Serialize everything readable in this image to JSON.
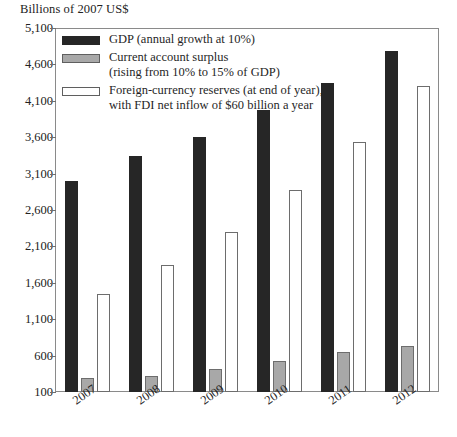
{
  "chart_data": {
    "type": "bar",
    "title": "",
    "ylabel": "Billions of 2007 US$",
    "xlabel": "",
    "grid": false,
    "legend_position": "top-left-inside",
    "ylim": [
      100,
      5100
    ],
    "ytick_labels": [
      "5,100",
      "4,600",
      "4,100",
      "3,600",
      "3,100",
      "2,600",
      "2,100",
      "1,600",
      "1,100",
      "600",
      "100"
    ],
    "yticks": [
      5100,
      4600,
      4100,
      3600,
      3100,
      2600,
      2100,
      1600,
      1100,
      600,
      100
    ],
    "categories": [
      "2007",
      "2008",
      "2009",
      "2010",
      "2011",
      "2012"
    ],
    "series": [
      {
        "name": "GDP (annual growth at 10%)",
        "color": "#262626",
        "values": [
          3000,
          3340,
          3600,
          3980,
          4350,
          4780
        ]
      },
      {
        "name": "Current account surplus (rising from 10% to 15% of GDP)",
        "color": "#a8a8a8",
        "values": [
          290,
          320,
          420,
          530,
          650,
          730
        ]
      },
      {
        "name": "Foreign-currency reserves (at end of year), with FDI net inflow of $60 billion a year",
        "color": "#ffffff",
        "values": [
          1440,
          1850,
          2300,
          2880,
          3540,
          4310
        ]
      }
    ]
  },
  "legend": {
    "items": [
      {
        "label_line1": "GDP (annual growth at 10%)",
        "label_line2": "",
        "swatch": "gdp"
      },
      {
        "label_line1": "Current account surplus",
        "label_line2": "(rising from 10% to 15% of GDP)",
        "swatch": "surplus"
      },
      {
        "label_line1": "Foreign-currency reserves (at end of year),",
        "label_line2": "with FDI net inflow of $60 billion a year",
        "swatch": "reserves"
      }
    ]
  },
  "axis": {
    "y_title": "Billions of 2007 US$"
  }
}
